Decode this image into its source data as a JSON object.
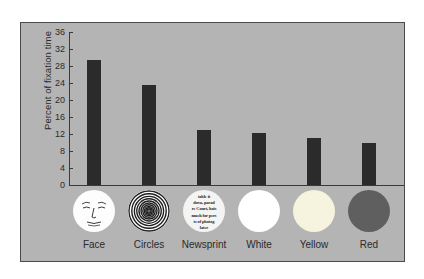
{
  "chart_data": {
    "type": "bar",
    "title": "",
    "xlabel": "",
    "ylabel": "Percent of fixation time",
    "categories": [
      "Face",
      "Circles",
      "Newsprint",
      "White",
      "Yellow",
      "Red"
    ],
    "values": [
      29.5,
      23.5,
      13.0,
      12.2,
      11.0,
      9.8
    ],
    "ylim": [
      0,
      36
    ],
    "yticks": [
      0,
      4,
      8,
      12,
      16,
      20,
      24,
      28,
      32,
      36
    ],
    "ytick_labels": [
      "0",
      "4",
      "8",
      "12",
      "16",
      "20",
      "24",
      "28",
      "32",
      "36"
    ],
    "grid": false,
    "legend": "none",
    "bar_color": "#2b2b2b",
    "panel_color": "#b4b4b4"
  },
  "axis": {
    "y_title": "Percent of fixation time",
    "ticks": [
      {
        "label": "36",
        "value": 36
      },
      {
        "label": "32",
        "value": 32
      },
      {
        "label": "28",
        "value": 28
      },
      {
        "label": "24",
        "value": 24
      },
      {
        "label": "20",
        "value": 20
      },
      {
        "label": "16",
        "value": 16
      },
      {
        "label": "12",
        "value": 12
      },
      {
        "label": "8",
        "value": 8
      },
      {
        "label": "4",
        "value": 4
      },
      {
        "label": "0",
        "value": 0
      }
    ]
  },
  "stimuli": [
    {
      "name": "Face",
      "label": "Face",
      "swatch": "schematic-face",
      "color": "#fdfdfd"
    },
    {
      "name": "Circles",
      "label": "Circles",
      "swatch": "concentric-circles",
      "color": "#ffffff"
    },
    {
      "name": "Newsprint",
      "label": "Newsprint",
      "swatch": "newsprint",
      "color": "#f4f4f2"
    },
    {
      "name": "White",
      "label": "White",
      "swatch": "solid-disc",
      "color": "#ffffff"
    },
    {
      "name": "Yellow",
      "label": "Yellow",
      "swatch": "solid-disc",
      "color": "#f6f4df"
    },
    {
      "name": "Red",
      "label": "Red",
      "swatch": "solid-disc",
      "color": "#5f5f5f"
    }
  ],
  "newsprint_text": {
    "line1": "table it",
    "line2": "dova, parad",
    "line3": "re Court, hois",
    "line4": "much for pers",
    "line5": "ts of photog",
    "line6": "later"
  }
}
